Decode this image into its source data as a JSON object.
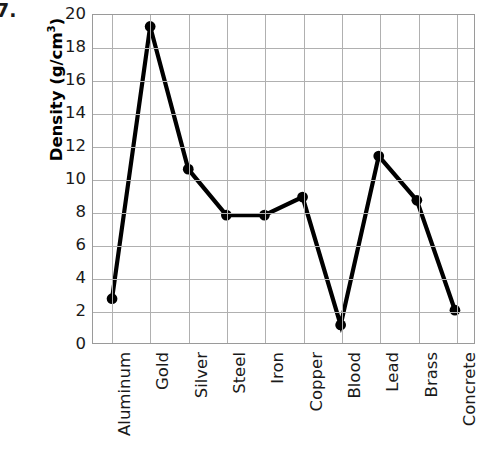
{
  "problem_number": "7.",
  "chart_data": {
    "type": "line",
    "title": "",
    "xlabel": "",
    "ylabel": "Density (g/cm3)",
    "ylabel_base": "Density (g/cm",
    "ylabel_exponent": "3",
    "ylabel_suffix": ")",
    "categories": [
      "Aluminum",
      "Gold",
      "Silver",
      "Steel",
      "Iron",
      "Copper",
      "Blood",
      "Lead",
      "Brass",
      "Concrete"
    ],
    "values": [
      2.7,
      19.3,
      10.6,
      7.8,
      7.8,
      8.9,
      1.1,
      11.4,
      8.7,
      2.0
    ],
    "ylim": [
      0,
      20
    ],
    "ytick_step": 2,
    "yticks": [
      0,
      2,
      4,
      6,
      8,
      10,
      12,
      14,
      16,
      18,
      20
    ],
    "ytick_labels": [
      "0",
      "2",
      "4",
      "6",
      "8",
      "10",
      "12",
      "14",
      "16",
      "18",
      "20"
    ],
    "grid": true,
    "legend": false,
    "line_color": "#000000",
    "marker_color": "#000000",
    "grid_color": "#b0b0b0",
    "axis_color": "#9a9a9a",
    "line_width": 4.2,
    "marker_radius": 5.4
  }
}
